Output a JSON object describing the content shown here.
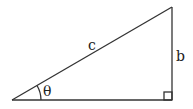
{
  "diagram": {
    "type": "right-triangle",
    "labels": {
      "hypotenuse": "c",
      "opposite": "b",
      "angle": "θ"
    },
    "vertices": {
      "angle_vertex": [
        12,
        100
      ],
      "top": [
        172,
        7
      ],
      "right_angle": [
        172,
        100
      ]
    },
    "colors": {
      "stroke": "#333333",
      "background": "#ffffff"
    }
  }
}
